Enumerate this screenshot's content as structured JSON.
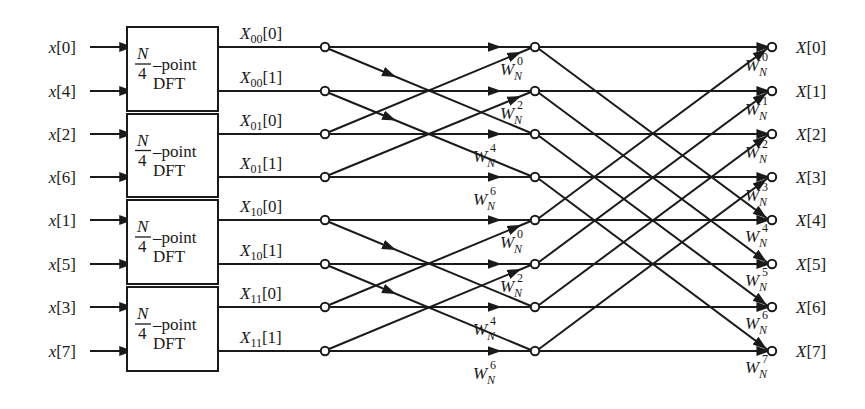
{
  "colors": {
    "ink": "#1a1a1a",
    "background": "#ffffff"
  },
  "layout": {
    "rows_y": [
      47,
      91,
      134,
      177,
      220,
      264,
      307,
      351
    ],
    "input_node_x": 86,
    "box_left": 127,
    "box_right": 218,
    "stage1_node_x": 325,
    "stage2_node_x": 535,
    "output_node_x": 772
  },
  "inputs": [
    {
      "label": "x[0]",
      "name": "x",
      "index": "0"
    },
    {
      "label": "x[4]",
      "name": "x",
      "index": "4"
    },
    {
      "label": "x[2]",
      "name": "x",
      "index": "2"
    },
    {
      "label": "x[6]",
      "name": "x",
      "index": "6"
    },
    {
      "label": "x[1]",
      "name": "x",
      "index": "1"
    },
    {
      "label": "x[5]",
      "name": "x",
      "index": "5"
    },
    {
      "label": "x[3]",
      "name": "x",
      "index": "3"
    },
    {
      "label": "x[7]",
      "name": "x",
      "index": "7"
    }
  ],
  "dft_blocks": [
    {
      "frac_num": "N",
      "frac_den": "4",
      "suffix": "–point",
      "line2": "DFT",
      "rows": [
        0,
        1
      ]
    },
    {
      "frac_num": "N",
      "frac_den": "4",
      "suffix": "–point",
      "line2": "DFT",
      "rows": [
        2,
        3
      ]
    },
    {
      "frac_num": "N",
      "frac_den": "4",
      "suffix": "–point",
      "line2": "DFT",
      "rows": [
        4,
        5
      ]
    },
    {
      "frac_num": "N",
      "frac_den": "4",
      "suffix": "–point",
      "line2": "DFT",
      "rows": [
        6,
        7
      ]
    }
  ],
  "intermediate_labels": [
    {
      "base": "X",
      "sub": "00",
      "index": "0"
    },
    {
      "base": "X",
      "sub": "00",
      "index": "1"
    },
    {
      "base": "X",
      "sub": "01",
      "index": "0"
    },
    {
      "base": "X",
      "sub": "01",
      "index": "1"
    },
    {
      "base": "X",
      "sub": "10",
      "index": "0"
    },
    {
      "base": "X",
      "sub": "10",
      "index": "1"
    },
    {
      "base": "X",
      "sub": "11",
      "index": "0"
    },
    {
      "base": "X",
      "sub": "11",
      "index": "1"
    }
  ],
  "stage1_twiddles": [
    {
      "row": 0,
      "base": "W",
      "sub": "N",
      "exp": "0"
    },
    {
      "row": 1,
      "base": "W",
      "sub": "N",
      "exp": "2"
    },
    {
      "row": 2,
      "base": "W",
      "sub": "N",
      "exp": "4"
    },
    {
      "row": 3,
      "base": "W",
      "sub": "N",
      "exp": "6"
    },
    {
      "row": 4,
      "base": "W",
      "sub": "N",
      "exp": "0"
    },
    {
      "row": 5,
      "base": "W",
      "sub": "N",
      "exp": "2"
    },
    {
      "row": 6,
      "base": "W",
      "sub": "N",
      "exp": "4"
    },
    {
      "row": 7,
      "base": "W",
      "sub": "N",
      "exp": "6"
    }
  ],
  "stage2_twiddles": [
    {
      "row": 0,
      "base": "W",
      "sub": "N",
      "exp": "0"
    },
    {
      "row": 1,
      "base": "W",
      "sub": "N",
      "exp": "1"
    },
    {
      "row": 2,
      "base": "W",
      "sub": "N",
      "exp": "2"
    },
    {
      "row": 3,
      "base": "W",
      "sub": "N",
      "exp": "3"
    },
    {
      "row": 4,
      "base": "W",
      "sub": "N",
      "exp": "4"
    },
    {
      "row": 5,
      "base": "W",
      "sub": "N",
      "exp": "5"
    },
    {
      "row": 6,
      "base": "W",
      "sub": "N",
      "exp": "6"
    },
    {
      "row": 7,
      "base": "W",
      "sub": "N",
      "exp": "7"
    }
  ],
  "outputs": [
    {
      "label": "X[0]",
      "name": "X",
      "index": "0"
    },
    {
      "label": "X[1]",
      "name": "X",
      "index": "1"
    },
    {
      "label": "X[2]",
      "name": "X",
      "index": "2"
    },
    {
      "label": "X[3]",
      "name": "X",
      "index": "3"
    },
    {
      "label": "X[4]",
      "name": "X",
      "index": "4"
    },
    {
      "label": "X[5]",
      "name": "X",
      "index": "5"
    },
    {
      "label": "X[6]",
      "name": "X",
      "index": "6"
    },
    {
      "label": "X[7]",
      "name": "X",
      "index": "7"
    }
  ],
  "stage1_butterflies": [
    {
      "top": 0,
      "bottom": 2
    },
    {
      "top": 1,
      "bottom": 3
    },
    {
      "top": 4,
      "bottom": 6
    },
    {
      "top": 5,
      "bottom": 7
    }
  ],
  "stage2_butterflies": [
    {
      "top": 0,
      "bottom": 4
    },
    {
      "top": 1,
      "bottom": 5
    },
    {
      "top": 2,
      "bottom": 6
    },
    {
      "top": 3,
      "bottom": 7
    }
  ]
}
